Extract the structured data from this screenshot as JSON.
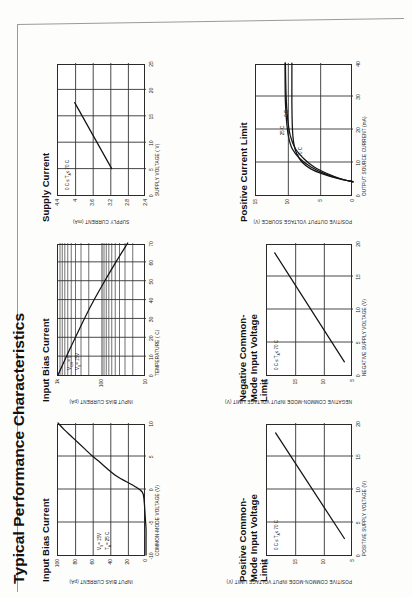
{
  "page": {
    "title": "Typical Performance Characteristics"
  },
  "chart_data": [
    {
      "id": "input-bias-current-vcm",
      "type": "line",
      "title": "Input Bias Current",
      "xlabel": "COMMON-MODE VOLTAGE (V)",
      "ylabel": "INPUT BIAS CURRENT (pA)",
      "xticks": [
        "-10",
        "-5",
        "0",
        "5",
        "10"
      ],
      "yticks": [
        "100",
        "80",
        "60",
        "40",
        "20",
        "0"
      ],
      "xlim": [
        -10,
        10
      ],
      "ylim": [
        0,
        100
      ],
      "grid": true,
      "annotations": [
        "V  = 15V",
        "T  = 25 C"
      ],
      "annotation_subs": [
        "S",
        "A"
      ],
      "series": [
        {
          "name": "IB",
          "x": [
            -10,
            -8,
            -6,
            -4,
            -2,
            -0.5,
            0.5,
            2,
            4,
            5,
            6,
            7,
            8,
            9,
            10
          ],
          "values": [
            0,
            0,
            0,
            1,
            2,
            4,
            14,
            34,
            52,
            61,
            69,
            77,
            85,
            93,
            100
          ]
        }
      ]
    },
    {
      "id": "input-bias-current-temp",
      "type": "line",
      "title": "Input Bias Current",
      "xlabel": "TEMPERATURE ( C)",
      "ylabel": "INPUT BIAS CURRENT (pA)",
      "xticks": [
        "0",
        "10",
        "20",
        "30",
        "40",
        "50",
        "60",
        "70"
      ],
      "yticks": [
        "1k",
        "100",
        "10"
      ],
      "xlim": [
        0,
        70
      ],
      "ylim": [
        10,
        1000
      ],
      "yscale": "log",
      "grid": true,
      "annotations": [
        "V    = 0",
        "V  = 15V"
      ],
      "annotation_subs": [
        "CM",
        "S"
      ],
      "series": [
        {
          "name": "IB",
          "x": [
            0,
            10,
            20,
            30,
            40,
            50,
            60,
            70
          ],
          "values": [
            1000,
            640,
            400,
            250,
            150,
            86,
            48,
            26
          ]
        }
      ]
    },
    {
      "id": "supply-current",
      "type": "line",
      "title": "Supply Current",
      "xlabel": "SUPPLY VOLTAGE ( V)",
      "ylabel": "SUPPLY CURRENT (mA)",
      "xticks": [
        "0",
        "5",
        "10",
        "15",
        "20",
        "25"
      ],
      "yticks": [
        "4.4",
        "4",
        "3.6",
        "3.2",
        "2.8",
        "2.4"
      ],
      "xlim": [
        0,
        25
      ],
      "ylim": [
        2.4,
        4.4
      ],
      "grid": true,
      "annotations": [
        "0 C ≤ T  ≤ 70 C"
      ],
      "annotation_subs": [
        "A"
      ],
      "series": [
        {
          "name": "IS",
          "x": [
            5,
            17.5
          ],
          "values": [
            3.18,
            4.02
          ]
        }
      ]
    },
    {
      "id": "positive-common-mode-input-voltage-limit",
      "type": "line",
      "title": "Positive Common-Mode Input Voltage Limit",
      "xlabel": "POSITIVE SUPPLY VOLTAGE (V)",
      "ylabel": "POSITIVE COMMON-MODE INPUT VOLTAGE LIMIT (V)",
      "xticks": [
        "0",
        "5",
        "10",
        "15",
        "20"
      ],
      "yticks": [
        "20",
        "15",
        "10",
        "5"
      ],
      "xlim": [
        0,
        20
      ],
      "ylim": [
        0,
        20
      ],
      "grid": true,
      "annotations": [
        "0 C ≤ T  ≤ 70 C"
      ],
      "annotation_subs": [
        "A"
      ],
      "series": [
        {
          "name": "Vcm+",
          "x": [
            2.5,
            18.5
          ],
          "values": [
            2.0,
            18.0
          ]
        }
      ]
    },
    {
      "id": "negative-common-mode-input-voltage-limit",
      "type": "line",
      "title": "Negative Common-Mode Input Voltage Limit",
      "xlabel": "NEGATIVE SUPPLY VOLTAGE (V)",
      "ylabel": "NEGATIVE COMMON-MODE INPUT VOLTAGE LIMIT (V)",
      "xticks": [
        "0",
        "5",
        "10",
        "15",
        "20"
      ],
      "yticks": [
        "20",
        "15",
        "10",
        "5"
      ],
      "xlim": [
        0,
        20
      ],
      "ylim": [
        0,
        20
      ],
      "grid": true,
      "annotations": [
        "0 C ≤ T  ≤ 70 C"
      ],
      "annotation_subs": [
        "A"
      ],
      "series": [
        {
          "name": "Vcm-",
          "x": [
            2.0,
            18.5
          ],
          "values": [
            2.0,
            18.2
          ]
        }
      ]
    },
    {
      "id": "positive-current-limit",
      "type": "line",
      "title": "Positive Current Limit",
      "xlabel": "OUTPUT SOURCE CURRENT (mA)",
      "ylabel": "POSITIVE OUTPUT VOLTAGE SOURCE (V)",
      "xticks": [
        "0",
        "10",
        "20",
        "30",
        "40"
      ],
      "yticks": [
        "15",
        "10",
        "5",
        "0"
      ],
      "xlim": [
        0,
        40
      ],
      "ylim": [
        0,
        15
      ],
      "grid": true,
      "annotations": [],
      "curve_labels": [
        "25 C",
        "0 C",
        "70 C"
      ],
      "series": [
        {
          "name": "0 C",
          "x": [
            4.0,
            5.0,
            6.5,
            8.5,
            11,
            14,
            18,
            23,
            28,
            34,
            40
          ],
          "values": [
            0,
            2.0,
            4.0,
            6.0,
            7.6,
            8.9,
            9.7,
            10.1,
            10.3,
            10.4,
            10.45
          ]
        },
        {
          "name": "25 C",
          "x": [
            4.0,
            5.0,
            6.5,
            8.5,
            11,
            14,
            18,
            23,
            28,
            34,
            40
          ],
          "values": [
            0,
            2.2,
            4.4,
            6.5,
            8.2,
            9.4,
            10.0,
            10.3,
            10.45,
            10.5,
            10.5
          ]
        },
        {
          "name": "70 C",
          "x": [
            4.0,
            5.0,
            6.3,
            8.0,
            10,
            12.5,
            15,
            18,
            22,
            28,
            34,
            40
          ],
          "values": [
            0,
            2.4,
            4.6,
            6.6,
            7.9,
            8.7,
            9.1,
            9.3,
            9.4,
            9.45,
            9.45,
            9.45
          ]
        }
      ]
    }
  ]
}
